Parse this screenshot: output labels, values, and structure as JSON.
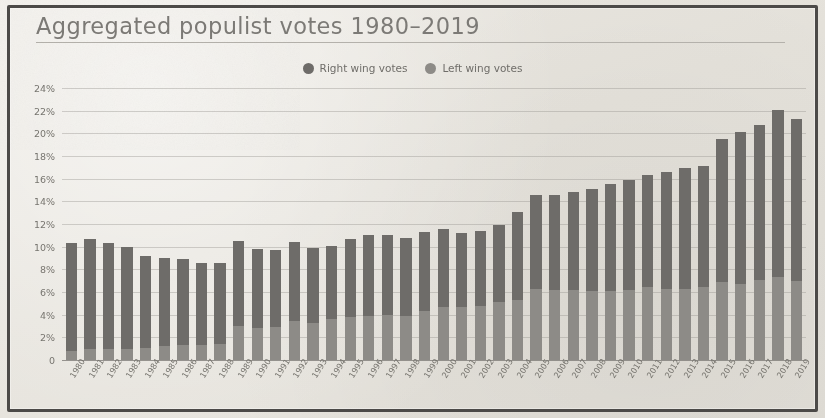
{
  "chart_title": "Aggregated populist votes 1980–2019",
  "legend": {
    "position": "top-center",
    "items": [
      {
        "label": "Right wing votes",
        "color": "#6e6c69",
        "icon": "legend-dot-icon"
      },
      {
        "label": "Left wing votes",
        "color": "#8d8b87",
        "icon": "legend-dot-icon"
      }
    ]
  },
  "colors": {
    "right_wing": "#6e6c69",
    "left_wing": "#8d8b87",
    "background": "#e8e6e1",
    "frame": "#4c4a48",
    "text": "#77756f",
    "gridline": "#96948f"
  },
  "chart_data": {
    "type": "bar",
    "stacked": true,
    "title": "Aggregated populist votes 1980–2019",
    "xlabel": "",
    "ylabel": "",
    "ylim": [
      0,
      24
    ],
    "yticks": [
      "0",
      "2%",
      "4%",
      "6%",
      "8%",
      "10%",
      "12%",
      "14%",
      "16%",
      "18%",
      "20%",
      "22%",
      "24%"
    ],
    "ytick_values": [
      0,
      2,
      4,
      6,
      8,
      10,
      12,
      14,
      16,
      18,
      20,
      22,
      24
    ],
    "grid": true,
    "legend_position": "top-center",
    "categories": [
      "1980",
      "1981",
      "1982",
      "1983",
      "1984",
      "1985",
      "1986",
      "1987",
      "1988",
      "1989",
      "1990",
      "1991",
      "1992",
      "1993",
      "1994",
      "1995",
      "1996",
      "1997",
      "1998",
      "1999",
      "2000",
      "2001",
      "2002",
      "2003",
      "2004",
      "2005",
      "2006",
      "2007",
      "2008",
      "2009",
      "2010",
      "2011",
      "2012",
      "2013",
      "2014",
      "2015",
      "2016",
      "2017",
      "2018",
      "2019"
    ],
    "series": [
      {
        "name": "Right wing votes",
        "color": "#6e6c69",
        "values": [
          9.5,
          9.7,
          9.3,
          9.0,
          8.1,
          7.8,
          7.6,
          7.3,
          7.2,
          7.5,
          7.0,
          6.8,
          7.0,
          6.6,
          6.5,
          6.9,
          7.1,
          7.0,
          6.9,
          7.0,
          6.9,
          6.5,
          6.6,
          6.8,
          7.8,
          8.3,
          8.4,
          8.6,
          9.0,
          9.4,
          9.7,
          9.9,
          10.3,
          10.6,
          10.7,
          12.6,
          13.4,
          13.6,
          14.8,
          14.3
        ]
      },
      {
        "name": "Left wing votes",
        "color": "#8d8b87",
        "values": [
          0.8,
          1.0,
          1.0,
          1.0,
          1.1,
          1.2,
          1.3,
          1.3,
          1.4,
          3.0,
          2.8,
          2.9,
          3.4,
          3.3,
          3.6,
          3.8,
          3.9,
          4.0,
          3.9,
          4.3,
          4.7,
          4.7,
          4.8,
          5.1,
          5.3,
          6.3,
          6.2,
          6.2,
          6.1,
          6.1,
          6.2,
          6.4,
          6.3,
          6.3,
          6.4,
          6.9,
          6.7,
          7.1,
          7.3,
          7.0
        ]
      }
    ],
    "totals": [
      10.3,
      10.7,
      10.3,
      10.0,
      9.2,
      9.0,
      8.9,
      8.6,
      8.6,
      10.5,
      9.8,
      9.7,
      10.4,
      9.9,
      10.1,
      10.7,
      11.0,
      11.0,
      10.8,
      11.3,
      11.6,
      11.2,
      11.4,
      11.9,
      13.1,
      14.6,
      14.6,
      14.8,
      15.1,
      15.5,
      15.9,
      16.3,
      16.6,
      16.9,
      17.1,
      19.5,
      20.1,
      20.7,
      22.1,
      21.3
    ]
  }
}
